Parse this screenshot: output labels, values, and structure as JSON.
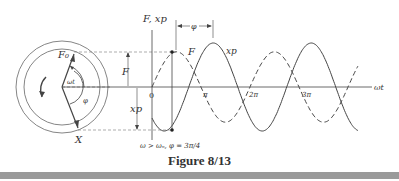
{
  "figure": {
    "caption": "Figure 8/13",
    "condition": "ω > ωₙ, φ = 3π/4"
  },
  "phasor": {
    "force_label": "F₀",
    "disp_label": "X",
    "angle_label": "ωt",
    "phase_label": "φ",
    "rotation": "counterclockwise"
  },
  "labels": {
    "y_axis": "F, xp",
    "x_axis": "ωt",
    "origin": "0",
    "F_height": "F",
    "xp_height": "xp",
    "phi_dim": "φ",
    "curve_F": "F",
    "curve_xp": "xp"
  },
  "chart_data": {
    "type": "line",
    "title": "Figure 8/13",
    "xlabel": "ωt",
    "ylabel": "F, xp",
    "x_ticks": [
      "0",
      "π",
      "2π",
      "3π"
    ],
    "x_range": [
      0,
      4.4
    ],
    "annotation": "ω > ωn, φ = 3π/4",
    "series": [
      {
        "name": "F",
        "style": "dashed",
        "function": "F0·sin(ωt)",
        "amplitude": 0.8,
        "phase": 0
      },
      {
        "name": "xp",
        "style": "solid",
        "function": "X·sin(ωt − φ)",
        "amplitude": 1.0,
        "phase_lag": "3π/4"
      }
    ],
    "phase_shift_annotation": "φ"
  },
  "colors": {
    "ink": "#444444",
    "bar": "#9a9a9a"
  }
}
